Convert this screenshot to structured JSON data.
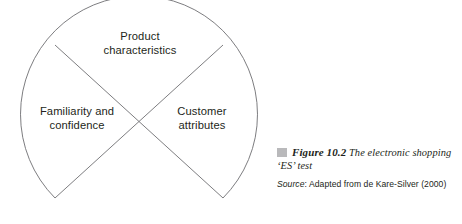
{
  "diagram": {
    "type": "circle-quadrant-segments",
    "shape_name": "electronic-shopping-es-test-diagram",
    "stroke_color": "#6e6e72",
    "segments": [
      {
        "id": "product",
        "line1": "Product",
        "line2": "characteristics",
        "position": "top"
      },
      {
        "id": "familiarity",
        "line1": "Familiarity and",
        "line2": "confidence",
        "position": "left"
      },
      {
        "id": "customer",
        "line1": "Customer",
        "line2": "attributes",
        "position": "right"
      }
    ]
  },
  "caption": {
    "marker_color": "#b9b9bb",
    "figure_number": "Figure 10.2",
    "figure_title": "The electronic shopping ‘ES’ test",
    "source_label": "Source",
    "source_separator": ":",
    "source_text": "Adapted from de Kare-Silver (2000)"
  }
}
